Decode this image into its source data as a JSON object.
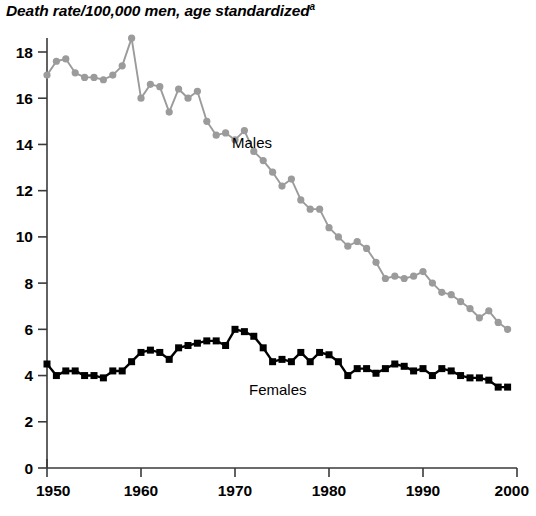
{
  "chart_data": {
    "type": "line",
    "title": "Death rate/100,000 men, age standardized",
    "title_superscript": "a",
    "xlabel": "",
    "ylabel": "",
    "xlim": [
      1950,
      2000
    ],
    "ylim": [
      0,
      19
    ],
    "grid": false,
    "legend_position": "inline-annotation",
    "x_ticks": [
      1950,
      1960,
      1970,
      1980,
      1990,
      2000
    ],
    "x_tick_labels": [
      "1950",
      "1960",
      "1970",
      "1980",
      "1990",
      "2000"
    ],
    "y_ticks": [
      0,
      2,
      4,
      6,
      8,
      10,
      12,
      14,
      16,
      18
    ],
    "y_tick_labels": [
      "0",
      "2",
      "4",
      "6",
      "8",
      "10",
      "12",
      "14",
      "16",
      "18"
    ],
    "x": [
      1950,
      1951,
      1952,
      1953,
      1954,
      1955,
      1956,
      1957,
      1958,
      1959,
      1960,
      1961,
      1962,
      1963,
      1964,
      1965,
      1966,
      1967,
      1968,
      1969,
      1970,
      1971,
      1972,
      1973,
      1974,
      1975,
      1976,
      1977,
      1978,
      1979,
      1980,
      1981,
      1982,
      1983,
      1984,
      1985,
      1986,
      1987,
      1988,
      1989,
      1990,
      1991,
      1992,
      1993,
      1994,
      1995,
      1996,
      1997,
      1998,
      1999
    ],
    "series": [
      {
        "name": "Males",
        "color": "#9b9b9b",
        "marker": "circle",
        "label_text": "Males",
        "values": [
          17.0,
          17.6,
          17.7,
          17.1,
          16.9,
          16.9,
          16.8,
          17.0,
          17.4,
          18.6,
          16.0,
          16.6,
          16.5,
          15.4,
          16.4,
          16.0,
          16.3,
          15.0,
          14.4,
          14.5,
          14.2,
          14.6,
          13.7,
          13.3,
          12.8,
          12.2,
          12.5,
          11.6,
          11.2,
          11.2,
          10.4,
          10.0,
          9.6,
          9.8,
          9.5,
          8.9,
          8.2,
          8.3,
          8.2,
          8.3,
          8.5,
          8.0,
          7.6,
          7.5,
          7.2,
          6.9,
          6.5,
          6.8,
          6.3,
          6.0
        ]
      },
      {
        "name": "Females",
        "color": "#000000",
        "marker": "square",
        "label_text": "Females",
        "values": [
          4.5,
          4.0,
          4.2,
          4.2,
          4.0,
          4.0,
          3.9,
          4.2,
          4.2,
          4.6,
          5.0,
          5.1,
          5.0,
          4.7,
          5.2,
          5.3,
          5.4,
          5.5,
          5.5,
          5.3,
          6.0,
          5.9,
          5.7,
          5.2,
          4.6,
          4.7,
          4.6,
          5.0,
          4.6,
          5.0,
          4.9,
          4.6,
          4.0,
          4.3,
          4.3,
          4.1,
          4.3,
          4.5,
          4.4,
          4.2,
          4.3,
          4.0,
          4.3,
          4.2,
          4.0,
          3.9,
          3.9,
          3.8,
          3.5,
          3.5
        ]
      }
    ]
  }
}
